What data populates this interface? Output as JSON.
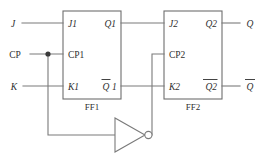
{
  "diagram": {
    "inputs": {
      "j": "J",
      "cp": "CP",
      "k": "K"
    },
    "outputs": {
      "q": "Q",
      "qbar": "Q"
    },
    "ff1": {
      "caption": "FF1",
      "j": "J1",
      "cp": "CP1",
      "k": "K1",
      "q": "Q1",
      "qbar_base": "Q",
      "qbar_suffix": "1"
    },
    "ff2": {
      "caption": "FF2",
      "j": "J2",
      "cp": "CP2",
      "k": "K2",
      "q": "Q2",
      "qbar": "Q2"
    },
    "gate": {
      "name": "inverter",
      "label": ""
    },
    "colors": {
      "wire": "#7a7a7a",
      "box": "#6e6e6e",
      "text": "#2f2f2f",
      "background": "#ffffff",
      "junction": "#3a3a3a"
    }
  }
}
